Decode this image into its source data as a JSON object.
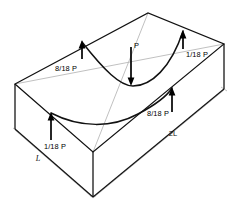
{
  "figure": {
    "type": "engineering-diagram",
    "colors": {
      "stroke": "#111111",
      "light_stroke": "#b9b9b9",
      "arrow": "#000000",
      "background": "#ffffff"
    }
  },
  "forces": [
    {
      "id": "force-top-left",
      "label": "8/18 P",
      "direction": "up",
      "position": "top-left-edge-midspan",
      "tip": {
        "x": 82,
        "y": 42
      },
      "tail": {
        "x": 82,
        "y": 58
      },
      "label_pos": {
        "x": 66,
        "y": 70
      }
    },
    {
      "id": "force-center",
      "label": "P",
      "direction": "down",
      "position": "plate-center",
      "tip": {
        "x": 131,
        "y": 84
      },
      "tail": {
        "x": 131,
        "y": 47
      },
      "label_pos": {
        "x": 133,
        "y": 47
      }
    },
    {
      "id": "force-top-right",
      "label": "1/18 P",
      "direction": "up",
      "position": "top-right-corner",
      "tip": {
        "x": 183,
        "y": 31
      },
      "tail": {
        "x": 183,
        "y": 48
      },
      "label_pos": {
        "x": 187,
        "y": 54
      }
    },
    {
      "id": "force-mid-right",
      "label": "8/18 P",
      "direction": "up",
      "position": "near-right-edge-midspan",
      "tip": {
        "x": 172,
        "y": 88
      },
      "tail": {
        "x": 172,
        "y": 110
      },
      "label_pos": {
        "x": 148,
        "y": 113
      }
    },
    {
      "id": "force-bottom-left",
      "label": "1/18 P",
      "direction": "up",
      "position": "bottom-left-corner",
      "tip": {
        "x": 51,
        "y": 113
      },
      "tail": {
        "x": 51,
        "y": 138
      },
      "label_pos": {
        "x": 44,
        "y": 146
      }
    }
  ],
  "dimensions": [
    {
      "id": "dim-short-side",
      "label": "L",
      "edge": "left-front-short-side",
      "label_pos": {
        "x": 38,
        "y": 159
      }
    },
    {
      "id": "dim-long-side",
      "label": "2L",
      "edge": "right-front-long-side",
      "label_pos": {
        "x": 173,
        "y": 133
      }
    }
  ],
  "geometry": {
    "top_face_corners": {
      "back": {
        "x": 148,
        "y": 13
      },
      "left": {
        "x": 15,
        "y": 84
      },
      "front": {
        "x": 93,
        "y": 152
      },
      "right": {
        "x": 224,
        "y": 44
      }
    },
    "depth_px": 46,
    "deflection": "saddle-shaped downward sag through plate center"
  }
}
